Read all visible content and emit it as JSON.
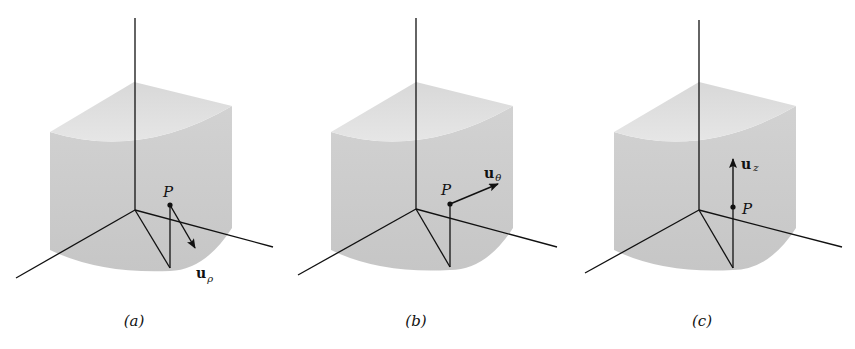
{
  "figure": {
    "colors": {
      "background": "#ffffff",
      "side_face": "#cfcfcf",
      "top_face": "#dedede",
      "lines": "#111111"
    },
    "panels": [
      {
        "id": "a",
        "caption": "(a)",
        "point_label": "P",
        "vector_label": "u",
        "vector_subscript": "ρ",
        "vector_name": "u_rho"
      },
      {
        "id": "b",
        "caption": "(b)",
        "point_label": "P",
        "vector_label": "u",
        "vector_subscript": "θ",
        "vector_name": "u_theta"
      },
      {
        "id": "c",
        "caption": "(c)",
        "point_label": "P",
        "vector_label": "u",
        "vector_subscript": "z",
        "vector_name": "u_z"
      }
    ]
  }
}
